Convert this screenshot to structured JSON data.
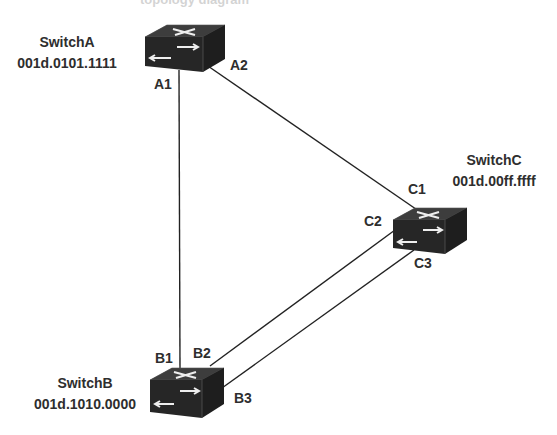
{
  "diagram": {
    "title_fragment": "topology diagram",
    "switches": [
      {
        "id": "A",
        "name": "SwitchA",
        "mac": "001d.0101.1111"
      },
      {
        "id": "B",
        "name": "SwitchB",
        "mac": "001d.1010.0000"
      },
      {
        "id": "C",
        "name": "SwitchC",
        "mac": "001d.00ff.ffff"
      }
    ],
    "ports": {
      "A1": "A1",
      "A2": "A2",
      "B1": "B1",
      "B2": "B2",
      "B3": "B3",
      "C1": "C1",
      "C2": "C2",
      "C3": "C3"
    },
    "links": [
      {
        "from": "A1",
        "to": "B1"
      },
      {
        "from": "A2",
        "to": "C1"
      },
      {
        "from": "B2",
        "to": "C2"
      },
      {
        "from": "B3",
        "to": "C3"
      }
    ],
    "colors": {
      "switch_body": "#2a2a2a",
      "switch_top": "#3a3a3a",
      "line": "#222222",
      "text": "#2e2e2e"
    },
    "icons": {
      "switch": "switch-icon"
    }
  }
}
